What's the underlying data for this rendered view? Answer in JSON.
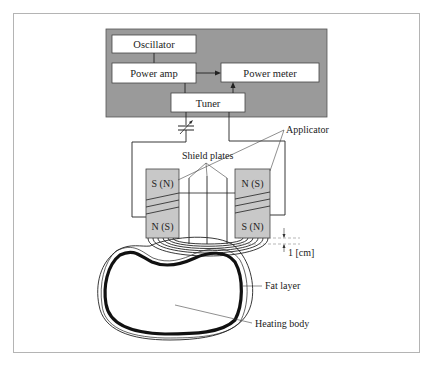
{
  "diagram": {
    "control_unit": {
      "oscillator": "Oscillator",
      "power_amp": "Power amp",
      "power_meter": "Power meter",
      "tuner": "Tuner",
      "background_color": "#9a9a9a"
    },
    "labels": {
      "applicator": "Applicator",
      "shield_plates": "Shield plates",
      "gap": "1 [cm]",
      "fat_layer": "Fat layer",
      "heating_body": "Heating body"
    },
    "magnets": {
      "left_top": "S (N)",
      "left_bottom": "N (S)",
      "right_top": "N (S)",
      "right_bottom": "S (N)",
      "fill_color": "#c8c8c8"
    }
  }
}
